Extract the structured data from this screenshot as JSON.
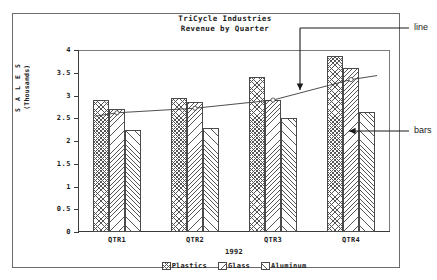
{
  "chart_data": {
    "type": "bar",
    "title": "TriCycle Industries",
    "subtitle": "Revenue by Quarter",
    "xlabel": "1992",
    "ylabel_line1": "S A L E S",
    "ylabel_line2": "(Thousands)",
    "categories": [
      "QTR1",
      "QTR2",
      "QTR3",
      "QTR4"
    ],
    "ylim": [
      0,
      4
    ],
    "ytick_labels": [
      "0",
      "0.5",
      "1",
      "1.5",
      "2",
      "2.5",
      "3",
      "3.5",
      "4"
    ],
    "ytick_values": [
      0,
      0.5,
      1,
      1.5,
      2,
      2.5,
      3,
      3.5,
      4
    ],
    "grid": false,
    "legend_position": "bottom-center",
    "series": [
      {
        "name": "Plastics",
        "pattern": "crosshatch",
        "values": [
          2.9,
          2.95,
          3.4,
          3.87
        ]
      },
      {
        "name": "Glass",
        "pattern": "backslash-hatch",
        "values": [
          2.7,
          2.85,
          2.9,
          3.6
        ]
      },
      {
        "name": "Aluminum",
        "pattern": "slash-hatch",
        "values": [
          2.25,
          2.28,
          2.5,
          2.63
        ]
      }
    ],
    "line_series": [
      {
        "name": "trend",
        "marker": "circle",
        "values": [
          2.62,
          2.72,
          2.9,
          3.35
        ]
      }
    ],
    "annotations": [
      {
        "label": "line",
        "target": "trend-line",
        "arrow": "down-left"
      },
      {
        "label": "bars",
        "target": "aluminum-bar-qtr4",
        "arrow": "left"
      }
    ]
  },
  "colors": {
    "ink": "#1a1a1a",
    "axis": "#3a3a3a",
    "frame": "#6b6b6b",
    "hatch": "#555555",
    "background": "#ffffff"
  }
}
